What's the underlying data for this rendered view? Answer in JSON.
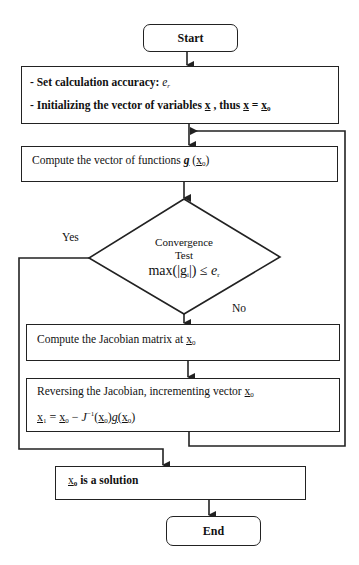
{
  "flowchart": {
    "start": {
      "label": "Start"
    },
    "init": {
      "line1_prefix": "- Set calculation accuracy: ",
      "line1_symbol": "e",
      "line1_symbol_sub": "r",
      "line2_prefix": "- Initializing the vector of variables ",
      "line2_var": "x",
      "line2_mid": " , thus ",
      "line2_eq": " = ",
      "line2_sub": "0"
    },
    "compute_g": {
      "text": "Compute the vector of functions ",
      "func": "g",
      "arg_open": "(",
      "arg_var": "x",
      "arg_sub": "0",
      "arg_close": ")"
    },
    "decision": {
      "line1": "Convergence",
      "line2": "Test",
      "formula_prefix": "max(|g",
      "formula_sub": "i",
      "formula_mid": "|) ≤ ",
      "formula_symbol": "e",
      "formula_symbol_sub": "r",
      "yes_label": "Yes",
      "no_label": "No"
    },
    "jacobian": {
      "text": "Compute the Jacobian matrix at ",
      "var": "x",
      "sub": "0"
    },
    "update": {
      "line1_text": "Reversing the Jacobian, incrementing  vector ",
      "line1_var": "x",
      "line1_sub": "0",
      "formula": {
        "lhs_var": "x",
        "lhs_sub": "1",
        "eq": " = ",
        "x0": "x",
        "x0_sub": "0",
        "minus": " − ",
        "J": "J",
        "J_sup": "−1",
        "open": "(",
        "close": ")",
        "g": "g"
      }
    },
    "solution": {
      "var": "x",
      "sub": "0",
      "text": " is a solution"
    },
    "end": {
      "label": "End"
    }
  },
  "colors": {
    "stroke": "#222222",
    "background": "#ffffff"
  }
}
